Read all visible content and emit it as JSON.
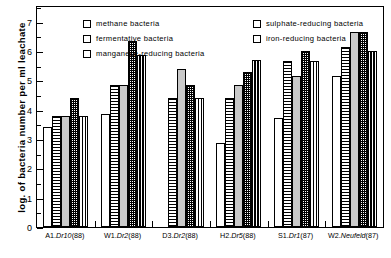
{
  "chart_data": {
    "type": "bar",
    "title": "",
    "xlabel": "",
    "ylabel": "log. of bacteria number per ml leachate",
    "ylim": [
      0,
      7.5
    ],
    "yticks": [
      "0",
      "1",
      "2",
      "3",
      "4",
      "5",
      "6",
      "7"
    ],
    "ytick_minor_step": 0.5,
    "grid": false,
    "legend_position": "inside-top",
    "categories": [
      "A1.Dr10(88)",
      "W1.Dr2(88)",
      "D3.Dr2(88)",
      "H2.Dr5(88)",
      "S1.Dr1(87)",
      "W2.Neufeld(87)"
    ],
    "series": [
      {
        "name": "methane bacteria",
        "pattern": "empty",
        "values": [
          3.4,
          3.85,
          null,
          2.85,
          3.7,
          5.15
        ]
      },
      {
        "name": "sulphate-reducing bacteria",
        "pattern": "horizontal-stripes",
        "values": [
          3.8,
          4.85,
          4.4,
          4.4,
          5.65,
          6.15
        ]
      },
      {
        "name": "fermentative bacteria",
        "pattern": "light-gray",
        "values": [
          3.8,
          4.85,
          5.4,
          4.85,
          5.15,
          6.65
        ]
      },
      {
        "name": "iron-reducing bacteria",
        "pattern": "dense-crosshatch",
        "values": [
          4.4,
          6.35,
          4.85,
          5.3,
          6.0,
          6.65
        ]
      },
      {
        "name": "manganese-reducing bacteria",
        "pattern": "checkerboard",
        "values": [
          3.8,
          5.85,
          4.4,
          5.7,
          5.65,
          6.0
        ]
      }
    ]
  },
  "legend": {
    "entries": [
      {
        "label": "methane bacteria",
        "swatch": "empty"
      },
      {
        "label": "sulphate-reducing bacteria",
        "swatch": "horizontal-stripes"
      },
      {
        "label": "fermentative bacteria",
        "swatch": "light-gray"
      },
      {
        "label": "iron-reducing bacteria",
        "swatch": "dense-crosshatch"
      },
      {
        "label": "manganese-reducing bacteria",
        "swatch": "checkerboard"
      }
    ]
  },
  "colors": {
    "axis": "#000000",
    "background": "#ffffff",
    "fill_gray": "#c9c9c9"
  }
}
